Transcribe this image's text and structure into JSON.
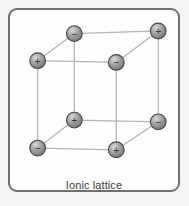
{
  "figure": {
    "caption": "Ionic lattice",
    "frame": {
      "border_color": "#6f6f6f",
      "background_color": "#fdfdfd",
      "page_background_color": "#f2f2f2"
    }
  },
  "chart_data": {
    "type": "diagram",
    "title": "Ionic lattice",
    "edge_color": "#b4b4b4",
    "ion_fill_color": "#9a9a9a",
    "ion_stroke_color": "#4a4a4a",
    "ion_radius": 9,
    "nodes": [
      {
        "id": "back-top-left",
        "charge": "−",
        "x": 72,
        "y": 27
      },
      {
        "id": "back-top-right",
        "charge": "+",
        "x": 168,
        "y": 24
      },
      {
        "id": "front-top-left",
        "charge": "+",
        "x": 30,
        "y": 58
      },
      {
        "id": "front-top-right",
        "charge": "−",
        "x": 120,
        "y": 60
      },
      {
        "id": "back-bottom-left",
        "charge": "+",
        "x": 72,
        "y": 126
      },
      {
        "id": "back-bottom-right",
        "charge": "−",
        "x": 168,
        "y": 128
      },
      {
        "id": "front-bottom-left",
        "charge": "−",
        "x": 30,
        "y": 158
      },
      {
        "id": "front-bottom-right",
        "charge": "+",
        "x": 120,
        "y": 160
      }
    ],
    "edges": [
      [
        "back-top-left",
        "back-top-right"
      ],
      [
        "back-top-left",
        "back-bottom-left"
      ],
      [
        "back-top-right",
        "back-bottom-right"
      ],
      [
        "back-bottom-left",
        "back-bottom-right"
      ],
      [
        "front-top-left",
        "front-top-right"
      ],
      [
        "front-top-left",
        "front-bottom-left"
      ],
      [
        "front-top-right",
        "front-bottom-right"
      ],
      [
        "front-bottom-left",
        "front-bottom-right"
      ],
      [
        "front-top-left",
        "back-top-left"
      ],
      [
        "front-top-right",
        "back-top-right"
      ],
      [
        "front-bottom-left",
        "back-bottom-left"
      ],
      [
        "front-bottom-right",
        "back-bottom-right"
      ]
    ]
  }
}
